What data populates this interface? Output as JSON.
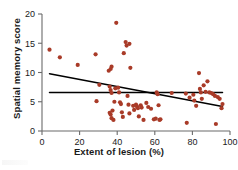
{
  "chart_data": {
    "type": "scatter",
    "title": "",
    "xlabel": "Extent of lesion (%)",
    "ylabel": "Spatial memory score",
    "xlim": [
      0,
      100
    ],
    "ylim": [
      0,
      20
    ],
    "xticks": [
      0,
      20,
      40,
      60,
      80,
      100
    ],
    "yticks": [
      0,
      5,
      10,
      15,
      20
    ],
    "grid": false,
    "legend": null,
    "point_color": "#a93b28",
    "line_color": "#000000",
    "axis_color": "#6b6b6b",
    "series": [
      {
        "name": "Individuals",
        "marker": "circle",
        "points": [
          [
            4.0,
            13.9
          ],
          [
            9.5,
            12.6
          ],
          [
            19.0,
            11.3
          ],
          [
            28.5,
            13.1
          ],
          [
            29.0,
            5.1
          ],
          [
            30.5,
            7.9
          ],
          [
            35.5,
            10.3
          ],
          [
            36.5,
            10.6
          ],
          [
            37.0,
            11.0
          ],
          [
            36.0,
            7.6
          ],
          [
            36.5,
            7.0
          ],
          [
            37.0,
            6.5
          ],
          [
            36.0,
            3.1
          ],
          [
            36.5,
            2.8
          ],
          [
            37.5,
            3.5
          ],
          [
            37.0,
            2.2
          ],
          [
            38.0,
            1.9
          ],
          [
            38.5,
            5.0
          ],
          [
            39.0,
            7.3
          ],
          [
            39.5,
            18.5
          ],
          [
            40.5,
            7.4
          ],
          [
            41.0,
            6.6
          ],
          [
            41.5,
            4.9
          ],
          [
            42.0,
            4.6
          ],
          [
            42.5,
            3.2
          ],
          [
            43.0,
            2.4
          ],
          [
            43.5,
            13.3
          ],
          [
            44.5,
            15.2
          ],
          [
            45.0,
            14.6
          ],
          [
            46.5,
            14.9
          ],
          [
            45.5,
            6.0
          ],
          [
            46.0,
            4.5
          ],
          [
            46.5,
            3.0
          ],
          [
            47.0,
            10.8
          ],
          [
            48.5,
            4.3
          ],
          [
            49.0,
            3.6
          ],
          [
            50.0,
            4.5
          ],
          [
            50.5,
            4.2
          ],
          [
            51.0,
            3.9
          ],
          [
            51.5,
            2.5
          ],
          [
            52.5,
            4.4
          ],
          [
            53.0,
            4.0
          ],
          [
            54.0,
            1.9
          ],
          [
            55.5,
            4.8
          ],
          [
            56.5,
            4.1
          ],
          [
            58.0,
            3.8
          ],
          [
            59.5,
            2.0
          ],
          [
            60.5,
            2.1
          ],
          [
            61.0,
            6.6
          ],
          [
            61.5,
            6.3
          ],
          [
            62.0,
            4.4
          ],
          [
            62.5,
            1.9
          ],
          [
            63.0,
            2.0
          ],
          [
            69.0,
            6.5
          ],
          [
            76.5,
            6.4
          ],
          [
            77.0,
            1.4
          ],
          [
            78.5,
            5.7
          ],
          [
            80.5,
            6.2
          ],
          [
            81.0,
            5.2
          ],
          [
            82.0,
            4.3
          ],
          [
            83.5,
            9.9
          ],
          [
            84.0,
            7.2
          ],
          [
            84.5,
            6.6
          ],
          [
            85.0,
            5.5
          ],
          [
            86.0,
            7.8
          ],
          [
            87.0,
            6.7
          ],
          [
            88.0,
            8.5
          ],
          [
            89.0,
            6.6
          ],
          [
            90.0,
            6.5
          ],
          [
            91.0,
            6.3
          ],
          [
            92.0,
            6.0
          ],
          [
            92.5,
            1.2
          ],
          [
            93.5,
            5.8
          ],
          [
            94.5,
            5.5
          ],
          [
            95.5,
            3.9
          ],
          [
            96.0,
            4.6
          ]
        ]
      }
    ],
    "fit_lines": [
      {
        "name": "regression-line",
        "style": "solid",
        "from": [
          4,
          9.8
        ],
        "to": [
          96,
          4.2
        ]
      },
      {
        "name": "reference-line",
        "style": "solid",
        "from": [
          4,
          6.6
        ],
        "to": [
          96,
          6.6
        ]
      }
    ]
  }
}
